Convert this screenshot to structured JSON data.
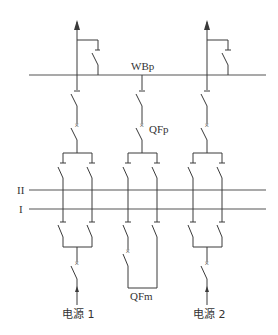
{
  "diagram": {
    "title": "",
    "labels": {
      "transfer_bus": "WBp",
      "transfer_breaker": "QFp",
      "bus_II": "II",
      "bus_I": "I",
      "bus_coupler_breaker": "QFm",
      "source_1": "电源 1",
      "source_2": "电源 2"
    },
    "colors": {
      "line": "#3a3a3a",
      "bus": "#555555",
      "background": "#ffffff"
    }
  }
}
